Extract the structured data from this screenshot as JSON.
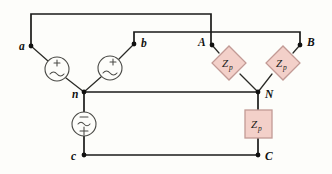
{
  "figure": {
    "type": "electrical-circuit-schematic",
    "background_color": "#fdfdfa",
    "wire_color": "#1a1a18",
    "impedance_fill": "#f3d0c9",
    "impedance_stroke": "#c29a95"
  },
  "nodes": [
    {
      "id": "a",
      "label": "a",
      "x": 31,
      "y": 46,
      "label_x": 19,
      "label_y": 49
    },
    {
      "id": "b",
      "label": "b",
      "x": 134,
      "y": 44,
      "label_x": 141,
      "label_y": 46
    },
    {
      "id": "n",
      "label": "n",
      "x": 84,
      "y": 92,
      "label_x": 72,
      "label_y": 97
    },
    {
      "id": "c",
      "label": "c",
      "x": 84,
      "y": 155,
      "label_x": 72,
      "label_y": 159
    },
    {
      "id": "A",
      "label": "A",
      "x": 212,
      "y": 45,
      "label_x": 199,
      "label_y": 45
    },
    {
      "id": "B",
      "label": "B",
      "x": 300,
      "y": 45,
      "label_x": 307,
      "label_y": 45
    },
    {
      "id": "N",
      "label": "N",
      "x": 258,
      "y": 92,
      "label_x": 265,
      "label_y": 97
    },
    {
      "id": "C",
      "label": "C",
      "x": 258,
      "y": 155,
      "label_x": 265,
      "label_y": 159
    }
  ],
  "sources": [
    {
      "id": "source-an",
      "phase": "a-n",
      "symbol": "ac-voltage-source",
      "cx": 57,
      "cy": 69,
      "r": 12,
      "polarity_top": "+"
    },
    {
      "id": "source-bn",
      "phase": "b-n",
      "symbol": "ac-voltage-source",
      "cx": 110,
      "cy": 68,
      "r": 12,
      "polarity_top": "+"
    },
    {
      "id": "source-cn",
      "phase": "c-n",
      "symbol": "ac-voltage-source",
      "cx": 84,
      "cy": 124,
      "r": 12,
      "polarity_top": "−",
      "polarity_bottom": "+"
    }
  ],
  "impedances": [
    {
      "id": "zp-A",
      "label": "Z",
      "subscript": "p",
      "shape": "diamond",
      "cx": 229,
      "cy": 63,
      "half": 16,
      "branch": "A-N"
    },
    {
      "id": "zp-B",
      "label": "Z",
      "subscript": "p",
      "shape": "diamond",
      "cx": 283,
      "cy": 63,
      "half": 16,
      "branch": "B-N"
    },
    {
      "id": "zp-C",
      "label": "Z",
      "subscript": "p",
      "shape": "square",
      "cx": 258,
      "cy": 124,
      "half": 14,
      "branch": "N-C"
    }
  ],
  "wires": [
    {
      "id": "wire-a-top",
      "path": "M 31 46 L 31 14 L 211 14 L 211 45"
    },
    {
      "id": "wire-b-top",
      "path": "M 134 44 L 134 32 L 300 32 L 300 45"
    },
    {
      "id": "wire-neutral",
      "path": "M 84 92 L 258 92"
    },
    {
      "id": "wire-bottom-cC",
      "path": "M 84 155 L 258 155"
    },
    {
      "id": "wire-n-source-c",
      "path": "M 84 92 L 84 112"
    },
    {
      "id": "wire-source-c-c",
      "path": "M 84 136 L 84 155"
    },
    {
      "id": "wire-N-zpC",
      "path": "M 258 92 L 258 110"
    },
    {
      "id": "wire-zpC-C",
      "path": "M 258 138 L 258 155"
    }
  ],
  "leads": [
    {
      "id": "lead-a-src",
      "path": "M 31 46 L 48 61"
    },
    {
      "id": "lead-src-n",
      "path": "M 66 78 L 84 92"
    },
    {
      "id": "lead-b-src",
      "path": "M 134 44 L 119 59"
    },
    {
      "id": "lead-src2-n",
      "path": "M 101 77 L 84 92"
    },
    {
      "id": "lead-A-zp",
      "path": "M 212 45 L 218 52"
    },
    {
      "id": "lead-zp-N",
      "path": "M 240 74 L 258 92"
    },
    {
      "id": "lead-B-zp",
      "path": "M 300 45 L 294 52"
    },
    {
      "id": "lead-zp2-N",
      "path": "M 272 74 L 258 92"
    }
  ]
}
